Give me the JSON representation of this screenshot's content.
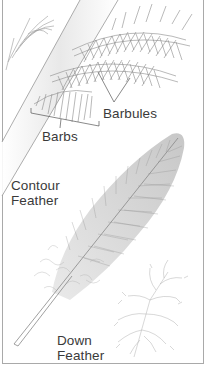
{
  "diagram": {
    "labels": {
      "barbules": "Barbules",
      "barbs": "Barbs",
      "contour_line1": "Contour",
      "contour_line2": "Feather",
      "down_line1": "Down",
      "down_line2": "Feather"
    },
    "colors": {
      "line": "#8a8a8a",
      "text": "#3a3a3a",
      "border": "#a9a9a9",
      "background": "#ffffff"
    }
  }
}
